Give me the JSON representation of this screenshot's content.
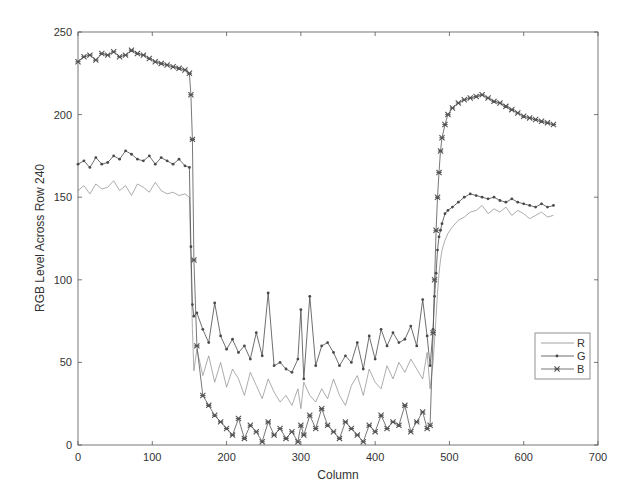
{
  "chart_data": {
    "type": "line",
    "title": "",
    "xlabel": "Column",
    "ylabel": "RGB Level Across Row 240",
    "xlim": [
      0,
      700
    ],
    "ylim": [
      0,
      250
    ],
    "xticks": [
      0,
      100,
      200,
      300,
      400,
      500,
      600,
      700
    ],
    "yticks": [
      0,
      50,
      100,
      150,
      200,
      250
    ],
    "grid": false,
    "legend_position": "east-inside",
    "x": [
      0,
      8,
      16,
      24,
      32,
      40,
      48,
      56,
      64,
      72,
      80,
      88,
      96,
      104,
      112,
      120,
      128,
      136,
      144,
      150,
      152,
      154,
      156,
      160,
      168,
      176,
      184,
      192,
      200,
      208,
      216,
      224,
      232,
      240,
      248,
      256,
      264,
      272,
      280,
      288,
      296,
      300,
      304,
      312,
      320,
      328,
      336,
      344,
      352,
      360,
      368,
      376,
      384,
      392,
      400,
      408,
      416,
      424,
      432,
      440,
      448,
      456,
      464,
      470,
      474,
      478,
      480,
      482,
      484,
      486,
      488,
      490,
      494,
      498,
      504,
      512,
      520,
      528,
      536,
      544,
      552,
      560,
      568,
      576,
      584,
      592,
      600,
      608,
      616,
      624,
      632,
      640
    ],
    "series": [
      {
        "name": "R",
        "marker": "none",
        "values": [
          154,
          157,
          152,
          158,
          155,
          156,
          160,
          154,
          157,
          151,
          158,
          156,
          153,
          159,
          154,
          152,
          153,
          151,
          152,
          150,
          112,
          70,
          45,
          58,
          42,
          54,
          38,
          50,
          35,
          46,
          40,
          30,
          44,
          36,
          28,
          40,
          32,
          26,
          30,
          24,
          34,
          22,
          38,
          30,
          26,
          34,
          28,
          40,
          30,
          24,
          36,
          42,
          30,
          46,
          38,
          34,
          48,
          40,
          50,
          44,
          52,
          46,
          40,
          56,
          34,
          50,
          64,
          78,
          92,
          104,
          112,
          118,
          124,
          128,
          132,
          136,
          138,
          141,
          142,
          145,
          140,
          143,
          141,
          144,
          139,
          142,
          140,
          137,
          139,
          141,
          138,
          139
        ]
      },
      {
        "name": "G",
        "marker": "dot",
        "values": [
          170,
          172,
          168,
          174,
          170,
          171,
          175,
          173,
          178,
          176,
          173,
          172,
          175,
          170,
          174,
          172,
          170,
          173,
          169,
          168,
          120,
          85,
          78,
          80,
          70,
          62,
          86,
          66,
          58,
          64,
          56,
          60,
          52,
          68,
          54,
          92,
          48,
          50,
          46,
          44,
          52,
          82,
          40,
          90,
          48,
          60,
          62,
          56,
          48,
          54,
          50,
          62,
          46,
          66,
          52,
          70,
          60,
          68,
          62,
          64,
          72,
          60,
          88,
          66,
          48,
          70,
          90,
          104,
          118,
          126,
          130,
          134,
          140,
          142,
          144,
          147,
          150,
          152,
          151,
          150,
          149,
          150,
          148,
          147,
          149,
          147,
          146,
          145,
          144,
          146,
          144,
          145
        ]
      },
      {
        "name": "B",
        "marker": "x",
        "values": [
          232,
          235,
          236,
          233,
          237,
          236,
          238,
          235,
          236,
          239,
          237,
          236,
          234,
          232,
          231,
          230,
          229,
          228,
          227,
          225,
          212,
          185,
          112,
          60,
          30,
          24,
          18,
          14,
          10,
          6,
          16,
          4,
          12,
          8,
          2,
          14,
          6,
          10,
          4,
          8,
          2,
          12,
          6,
          18,
          10,
          22,
          12,
          8,
          4,
          14,
          10,
          6,
          2,
          12,
          8,
          18,
          10,
          14,
          12,
          24,
          8,
          14,
          20,
          10,
          12,
          68,
          100,
          130,
          150,
          165,
          178,
          186,
          194,
          200,
          204,
          207,
          209,
          210,
          211,
          212,
          210,
          208,
          207,
          205,
          203,
          201,
          199,
          198,
          197,
          196,
          195,
          194
        ]
      }
    ]
  },
  "colors": {
    "axis": "#555555",
    "R": "#8a8a8a",
    "G": "#4a4a4a",
    "B": "#555555"
  },
  "legend": {
    "items": [
      "R",
      "G",
      "B"
    ]
  }
}
